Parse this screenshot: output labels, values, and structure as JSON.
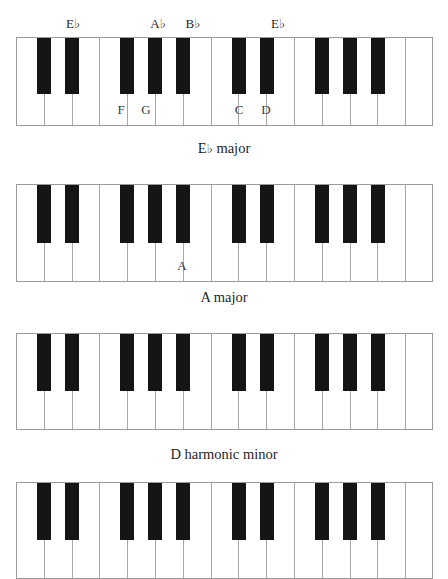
{
  "document": {
    "type": "music-theory-figure",
    "description": "Piano keyboard diagrams showing scales",
    "background_color": "#ffffff",
    "white_key_color": "#ffffff",
    "black_key_color": "#151515",
    "outline_color": "#9a9a9a"
  },
  "keyboard_layout": {
    "white_key_count": 15,
    "black_key_pattern": [
      1,
      1,
      0,
      1,
      1,
      1,
      0
    ],
    "note_names": [
      "C",
      "D",
      "E",
      "F",
      "G",
      "A",
      "B"
    ]
  },
  "figures": [
    {
      "id": "figure-eb-major",
      "caption": "E♭ major",
      "caption_text": "E",
      "caption_flat": "♭",
      "caption_suffix": " major",
      "top_labels": [
        {
          "text": "E",
          "flat": "♭",
          "x": 73
        },
        {
          "text": "A",
          "flat": "♭",
          "x": 158
        },
        {
          "text": "B",
          "flat": "♭",
          "x": 193
        },
        {
          "text": "E",
          "flat": "♭",
          "x": 278
        }
      ],
      "white_labels": [
        {
          "text": "F",
          "x": 121
        },
        {
          "text": "G",
          "x": 146
        },
        {
          "text": "C",
          "x": 239
        },
        {
          "text": "D",
          "x": 266
        }
      ]
    },
    {
      "id": "figure-a-major",
      "caption": "A major",
      "caption_text": "A major",
      "caption_flat": "",
      "caption_suffix": "",
      "top_labels": [],
      "white_labels": [
        {
          "text": "A",
          "x": 182
        }
      ]
    },
    {
      "id": "figure-d-harmonic-minor",
      "caption": "D harmonic minor",
      "caption_text": "D harmonic minor",
      "caption_flat": "",
      "caption_suffix": "",
      "top_labels": [],
      "white_labels": []
    },
    {
      "id": "figure-fourth-partial",
      "caption": "",
      "caption_text": "",
      "caption_flat": "",
      "caption_suffix": "",
      "top_labels": [],
      "white_labels": []
    }
  ]
}
